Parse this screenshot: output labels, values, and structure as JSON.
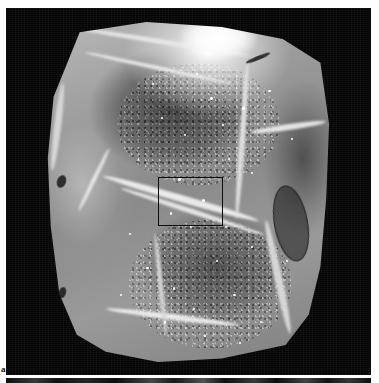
{
  "figure": {
    "panel_letter": "a",
    "modality": "grayscale anatomical cross-section photograph",
    "background_color": "#050505",
    "specimen_tone": "#8c8c8c",
    "roi_box": {
      "name": "region-of-interest-rectangle",
      "stroke_color": "#0d0d0d",
      "x": 158,
      "y": 177,
      "width": 65,
      "height": 49
    },
    "overlays": [
      {
        "name": "specular-glare",
        "label": ""
      },
      {
        "name": "dark-oval-structure",
        "label": ""
      }
    ],
    "next_panel": {
      "name": "next-figure-panel-sliver",
      "label": ""
    }
  },
  "canvas": {
    "width": 379,
    "height": 383,
    "page_color": "#fefefe",
    "photo": {
      "x": 6,
      "y": 8,
      "width": 365,
      "height": 367
    }
  },
  "pinpoints": [
    {
      "x": 58,
      "y": 22,
      "r": 1.4
    },
    {
      "x": 64,
      "y": 40,
      "r": 1.1
    },
    {
      "x": 49,
      "y": 33,
      "r": 1.0
    },
    {
      "x": 55,
      "y": 52,
      "r": 1.5
    },
    {
      "x": 62,
      "y": 30,
      "r": 1.0
    },
    {
      "x": 47,
      "y": 46,
      "r": 1.2
    },
    {
      "x": 53,
      "y": 15,
      "r": 1.0
    },
    {
      "x": 41,
      "y": 28,
      "r": 1.1
    },
    {
      "x": 69,
      "y": 25,
      "r": 1.3
    },
    {
      "x": 72,
      "y": 44,
      "r": 1.0
    },
    {
      "x": 44,
      "y": 56,
      "r": 1.4
    },
    {
      "x": 51,
      "y": 60,
      "r": 1.2
    },
    {
      "x": 38,
      "y": 18,
      "r": 0.9
    },
    {
      "x": 78,
      "y": 20,
      "r": 1.2
    },
    {
      "x": 36,
      "y": 72,
      "r": 1.1
    },
    {
      "x": 45,
      "y": 78,
      "r": 1.3
    },
    {
      "x": 52,
      "y": 84,
      "r": 1.0
    },
    {
      "x": 60,
      "y": 70,
      "r": 1.2
    },
    {
      "x": 66,
      "y": 80,
      "r": 1.1
    },
    {
      "x": 56,
      "y": 92,
      "r": 1.0
    },
    {
      "x": 42,
      "y": 88,
      "r": 1.2
    },
    {
      "x": 63,
      "y": 60,
      "r": 1.1
    },
    {
      "x": 72,
      "y": 66,
      "r": 0.9
    },
    {
      "x": 30,
      "y": 62,
      "r": 1.0
    },
    {
      "x": 84,
      "y": 70,
      "r": 1.2
    },
    {
      "x": 86,
      "y": 34,
      "r": 1.0
    },
    {
      "x": 75,
      "y": 88,
      "r": 1.1
    },
    {
      "x": 33,
      "y": 40,
      "r": 0.9
    },
    {
      "x": 27,
      "y": 80,
      "r": 1.0
    },
    {
      "x": 68,
      "y": 94,
      "r": 1.0
    }
  ]
}
